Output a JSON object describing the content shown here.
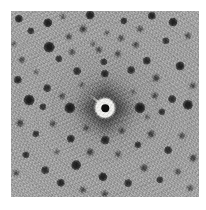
{
  "image": {
    "kind": "diffraction-pattern",
    "title": "X-ray Laue diffraction pattern",
    "alt_text": "Grayscale square diffraction pattern with central beam stop and fourfold array of dark Bragg spots",
    "canvas": {
      "width": 206,
      "height": 210,
      "background": "#ffffff"
    },
    "plate": {
      "x": 11,
      "y": 11,
      "width": 188,
      "height": 186,
      "background_color": "#a6a6a6",
      "border_margin_color": "#ffffff"
    },
    "symmetry": "four-fold (4mm)",
    "center": {
      "x": 105,
      "y": 108
    },
    "beam_stop": {
      "label": "beam stop",
      "outer_radius": 9.5,
      "core_radius": 4.2,
      "ring_color": "#f4f4f2",
      "core_color": "#0d0d0d",
      "support_arm": {
        "angle_deg": 222,
        "length": 20,
        "thickness": 2.2
      }
    },
    "diffuse_star": {
      "label": "thermal diffuse scattering streaks",
      "halo_radius": 30,
      "arms": [
        {
          "angle_deg": 0,
          "length": 34,
          "thickness": 12
        },
        {
          "angle_deg": 90,
          "length": 32,
          "thickness": 12
        },
        {
          "angle_deg": 180,
          "length": 34,
          "thickness": 12
        },
        {
          "angle_deg": 270,
          "length": 32,
          "thickness": 12
        },
        {
          "angle_deg": 45,
          "length": 24,
          "thickness": 8
        },
        {
          "angle_deg": 135,
          "length": 24,
          "thickness": 8
        },
        {
          "angle_deg": 225,
          "length": 24,
          "thickness": 8
        },
        {
          "angle_deg": 315,
          "length": 24,
          "thickness": 8
        }
      ]
    },
    "ring_spacing": 17,
    "spots": [
      {
        "x": 19,
        "y": 19,
        "r": 3.4,
        "i": 0.88
      },
      {
        "x": 31,
        "y": 31,
        "r": 3.0,
        "i": 0.8
      },
      {
        "x": 48,
        "y": 23,
        "r": 3.8,
        "i": 0.92
      },
      {
        "x": 49,
        "y": 47,
        "r": 4.4,
        "i": 0.95
      },
      {
        "x": 59,
        "y": 59,
        "r": 3.0,
        "i": 0.78
      },
      {
        "x": 63,
        "y": 17,
        "r": 2.2,
        "i": 0.62
      },
      {
        "x": 69,
        "y": 37,
        "r": 2.6,
        "i": 0.7
      },
      {
        "x": 72,
        "y": 52,
        "r": 2.4,
        "i": 0.66
      },
      {
        "x": 77,
        "y": 71,
        "r": 3.2,
        "i": 0.82
      },
      {
        "x": 83,
        "y": 29,
        "r": 2.8,
        "i": 0.74
      },
      {
        "x": 90,
        "y": 15,
        "r": 3.6,
        "i": 0.9
      },
      {
        "x": 99,
        "y": 50,
        "r": 2.6,
        "i": 0.7
      },
      {
        "x": 104,
        "y": 62,
        "r": 3.0,
        "i": 0.78
      },
      {
        "x": 107,
        "y": 33,
        "r": 2.2,
        "i": 0.6
      },
      {
        "x": 118,
        "y": 54,
        "r": 2.6,
        "i": 0.7
      },
      {
        "x": 121,
        "y": 38,
        "r": 2.4,
        "i": 0.66
      },
      {
        "x": 124,
        "y": 21,
        "r": 3.0,
        "i": 0.8
      },
      {
        "x": 131,
        "y": 70,
        "r": 3.2,
        "i": 0.82
      },
      {
        "x": 136,
        "y": 45,
        "r": 2.6,
        "i": 0.7
      },
      {
        "x": 140,
        "y": 29,
        "r": 2.4,
        "i": 0.64
      },
      {
        "x": 147,
        "y": 61,
        "r": 3.4,
        "i": 0.86
      },
      {
        "x": 152,
        "y": 16,
        "r": 3.4,
        "i": 0.88
      },
      {
        "x": 156,
        "y": 78,
        "r": 2.8,
        "i": 0.74
      },
      {
        "x": 166,
        "y": 41,
        "r": 3.0,
        "i": 0.78
      },
      {
        "x": 173,
        "y": 22,
        "r": 3.6,
        "i": 0.9
      },
      {
        "x": 180,
        "y": 66,
        "r": 3.6,
        "i": 0.9
      },
      {
        "x": 188,
        "y": 36,
        "r": 2.6,
        "i": 0.7
      },
      {
        "x": 22,
        "y": 60,
        "r": 2.6,
        "i": 0.7
      },
      {
        "x": 18,
        "y": 80,
        "r": 3.4,
        "i": 0.86
      },
      {
        "x": 29,
        "y": 100,
        "r": 4.4,
        "i": 0.95
      },
      {
        "x": 47,
        "y": 88,
        "r": 3.2,
        "i": 0.82
      },
      {
        "x": 43,
        "y": 107,
        "r": 3.0,
        "i": 0.78
      },
      {
        "x": 62,
        "y": 96,
        "r": 2.4,
        "i": 0.66
      },
      {
        "x": 70,
        "y": 108,
        "r": 4.6,
        "i": 0.96
      },
      {
        "x": 82,
        "y": 85,
        "r": 2.2,
        "i": 0.58
      },
      {
        "x": 140,
        "y": 108,
        "r": 4.6,
        "i": 0.96
      },
      {
        "x": 155,
        "y": 96,
        "r": 2.6,
        "i": 0.7
      },
      {
        "x": 162,
        "y": 112,
        "r": 3.0,
        "i": 0.78
      },
      {
        "x": 172,
        "y": 99,
        "r": 3.2,
        "i": 0.82
      },
      {
        "x": 188,
        "y": 105,
        "r": 4.2,
        "i": 0.94
      },
      {
        "x": 193,
        "y": 86,
        "r": 2.6,
        "i": 0.68
      },
      {
        "x": 105,
        "y": 140,
        "r": 3.6,
        "i": 0.88
      },
      {
        "x": 105,
        "y": 74,
        "r": 3.4,
        "i": 0.86
      },
      {
        "x": 20,
        "y": 123,
        "r": 2.8,
        "i": 0.74
      },
      {
        "x": 36,
        "y": 134,
        "r": 3.0,
        "i": 0.78
      },
      {
        "x": 53,
        "y": 124,
        "r": 2.6,
        "i": 0.68
      },
      {
        "x": 71,
        "y": 139,
        "r": 3.4,
        "i": 0.86
      },
      {
        "x": 86,
        "y": 128,
        "r": 2.4,
        "i": 0.64
      },
      {
        "x": 90,
        "y": 152,
        "r": 2.8,
        "i": 0.74
      },
      {
        "x": 122,
        "y": 131,
        "r": 2.6,
        "i": 0.7
      },
      {
        "x": 118,
        "y": 154,
        "r": 2.4,
        "i": 0.64
      },
      {
        "x": 138,
        "y": 145,
        "r": 3.0,
        "i": 0.78
      },
      {
        "x": 151,
        "y": 134,
        "r": 2.8,
        "i": 0.74
      },
      {
        "x": 168,
        "y": 150,
        "r": 3.2,
        "i": 0.82
      },
      {
        "x": 182,
        "y": 136,
        "r": 2.6,
        "i": 0.68
      },
      {
        "x": 193,
        "y": 158,
        "r": 2.8,
        "i": 0.72
      },
      {
        "x": 26,
        "y": 155,
        "r": 3.0,
        "i": 0.8
      },
      {
        "x": 16,
        "y": 173,
        "r": 2.4,
        "i": 0.64
      },
      {
        "x": 45,
        "y": 170,
        "r": 3.2,
        "i": 0.82
      },
      {
        "x": 61,
        "y": 183,
        "r": 3.4,
        "i": 0.86
      },
      {
        "x": 76,
        "y": 165,
        "r": 4.0,
        "i": 0.92
      },
      {
        "x": 83,
        "y": 190,
        "r": 2.6,
        "i": 0.68
      },
      {
        "x": 103,
        "y": 177,
        "r": 3.8,
        "i": 0.9
      },
      {
        "x": 105,
        "y": 194,
        "r": 2.6,
        "i": 0.7
      },
      {
        "x": 128,
        "y": 183,
        "r": 3.2,
        "i": 0.82
      },
      {
        "x": 144,
        "y": 168,
        "r": 2.8,
        "i": 0.74
      },
      {
        "x": 160,
        "y": 180,
        "r": 3.0,
        "i": 0.78
      },
      {
        "x": 178,
        "y": 172,
        "r": 2.6,
        "i": 0.68
      },
      {
        "x": 190,
        "y": 188,
        "r": 2.4,
        "i": 0.62
      },
      {
        "x": 14,
        "y": 44,
        "r": 2.2,
        "i": 0.58
      },
      {
        "x": 36,
        "y": 72,
        "r": 2.0,
        "i": 0.54
      },
      {
        "x": 93,
        "y": 44,
        "r": 2.0,
        "i": 0.54
      },
      {
        "x": 57,
        "y": 152,
        "r": 2.2,
        "i": 0.58
      },
      {
        "x": 147,
        "y": 117,
        "r": 2.0,
        "i": 0.54
      },
      {
        "x": 133,
        "y": 92,
        "r": 2.0,
        "i": 0.52
      }
    ]
  }
}
